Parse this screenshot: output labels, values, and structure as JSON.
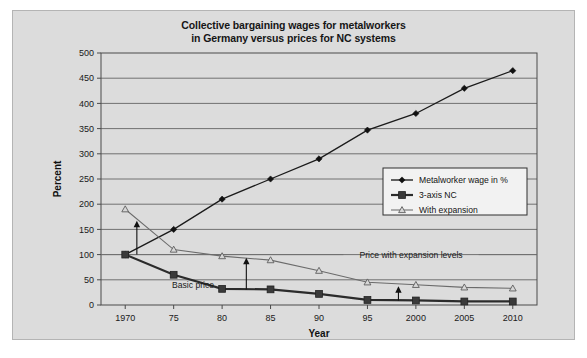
{
  "chart_data": {
    "type": "line",
    "title": "Collective bargaining wages for metalworkers in Germany versus prices for NC systems",
    "title_line1": "Collective bargaining wages for metalworkers",
    "title_line2": "in Germany versus prices for NC systems",
    "xlabel": "Year",
    "ylabel": "Percent",
    "x": [
      1970,
      1975,
      1980,
      1985,
      1990,
      1995,
      2000,
      2005,
      2010
    ],
    "xtick_labels": [
      "1970",
      "75",
      "80",
      "85",
      "90",
      "95",
      "2000",
      "2005",
      "2010"
    ],
    "ytick_labels": [
      "0",
      "50",
      "100",
      "150",
      "200",
      "250",
      "300",
      "350",
      "400",
      "450",
      "500"
    ],
    "ytick_values": [
      0,
      50,
      100,
      150,
      200,
      250,
      300,
      350,
      400,
      450,
      500
    ],
    "xlim": [
      1967.5,
      2012.5
    ],
    "ylim": [
      0,
      500
    ],
    "grid": "horizontal",
    "legend_position": "center-right",
    "series": [
      {
        "name": "Metalworker wage in %",
        "marker": "diamond",
        "values": [
          100,
          150,
          210,
          250,
          290,
          347,
          380,
          430,
          465
        ]
      },
      {
        "name": "3-axis NC",
        "marker": "square",
        "values": [
          100,
          60,
          32,
          31,
          22,
          10,
          9,
          7,
          7
        ]
      },
      {
        "name": "With expansion",
        "marker": "triangle",
        "values": [
          190,
          110,
          97,
          89,
          68,
          45,
          40,
          35,
          33
        ]
      }
    ],
    "annotations": [
      {
        "text": "Basic price",
        "x": 1977.0,
        "y": 40
      },
      {
        "text": "Price with expansion levels",
        "x": 1999.5,
        "y": 100
      }
    ],
    "arrows": [
      {
        "x": 1971.2,
        "y0": 100,
        "y1": 165
      },
      {
        "x": 1982.5,
        "y0": 31,
        "y1": 92
      },
      {
        "x": 1998.2,
        "y0": 9,
        "y1": 35
      }
    ]
  },
  "colors": {
    "panel_background": "#dcdcdc",
    "figure_background": "#ffffff",
    "wage_series": "#1b1b1b",
    "basic_price_series": "#2b2b2b",
    "expansion_series": "#6b6b6b",
    "grid": "#555555",
    "frame": "#4a4a4a"
  }
}
